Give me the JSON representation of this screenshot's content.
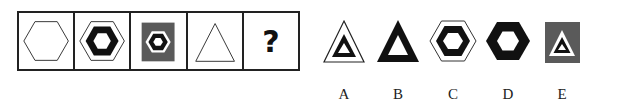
{
  "sequence": {
    "cells": [
      {
        "shape": "hexagon-outline"
      },
      {
        "shape": "hexagon-thick-in-hexagon-outline"
      },
      {
        "shape": "hexagon-in-hexagon-on-gray-square"
      },
      {
        "shape": "triangle-outline"
      },
      {
        "shape": "question",
        "text": "?"
      }
    ]
  },
  "options": [
    {
      "label": "A",
      "shape": "thick-triangle-in-triangle-outline"
    },
    {
      "label": "B",
      "shape": "thick-triangle"
    },
    {
      "label": "C",
      "shape": "thick-hexagon-in-hexagon-outline"
    },
    {
      "label": "D",
      "shape": "thick-hexagon"
    },
    {
      "label": "E",
      "shape": "triangle-in-triangle-on-gray-square"
    }
  ],
  "colors": {
    "stroke": "#222222",
    "gray": "#5a5a5a",
    "black": "#111111"
  }
}
